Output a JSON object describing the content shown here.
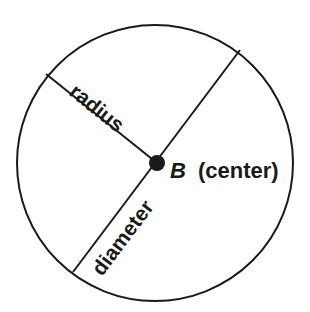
{
  "diagram": {
    "labels": {
      "radius": "radius",
      "diameter": "diameter",
      "center_point": "B",
      "center_text": "(center)"
    },
    "colors": {
      "stroke": "#1a1a1a",
      "background": "#ffffff"
    }
  }
}
